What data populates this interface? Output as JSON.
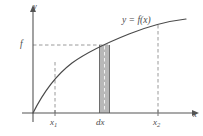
{
  "figure": {
    "colors": {
      "axis": "#555555",
      "curve": "#4a4a4a",
      "dashed_guide": "#9a9a9a",
      "strip_fill": "#b8b8b8",
      "strip_border": "#6e6e6e",
      "text": "#4d4d4d",
      "background": "#ffffff"
    },
    "axes": {
      "x_label": "x",
      "y_label": "y",
      "origin": {
        "x": 33,
        "y": 113
      },
      "x_axis_end": {
        "x": 196,
        "y": 113
      },
      "y_axis_top": {
        "x": 33,
        "y": 10
      }
    },
    "curve": {
      "label": "y = f(x)",
      "shape": "increasing concave-down then slightly upturning curve through origin",
      "path": "M 33 113 C 44 92, 56 74, 72 62 C 90 49, 108 42, 128 34 C 148 26, 168 21, 186 19"
    },
    "level_line": {
      "label": "f",
      "y": 45,
      "from_x": 33,
      "to_x": 108,
      "style": "dashed"
    },
    "markers": [
      {
        "name": "x1",
        "label": "x",
        "subscript": "1",
        "x": 55,
        "top_y": 62,
        "bottom_y": 113,
        "style": "dashed"
      },
      {
        "name": "dx",
        "label": "dx",
        "subscript": "",
        "x": 104,
        "top_y": 45,
        "bottom_y": 113,
        "style": "dashed-inside-shaded-strip"
      },
      {
        "name": "x2",
        "label": "x",
        "subscript": "2",
        "x": 158,
        "top_y": 25,
        "bottom_y": 113,
        "style": "dashed"
      }
    ],
    "strip": {
      "label": "dx",
      "left_x": 99,
      "right_x": 110,
      "top_y": 45,
      "bottom_y": 113,
      "fill": "#b8b8b8",
      "border": "#6e6e6e"
    }
  }
}
